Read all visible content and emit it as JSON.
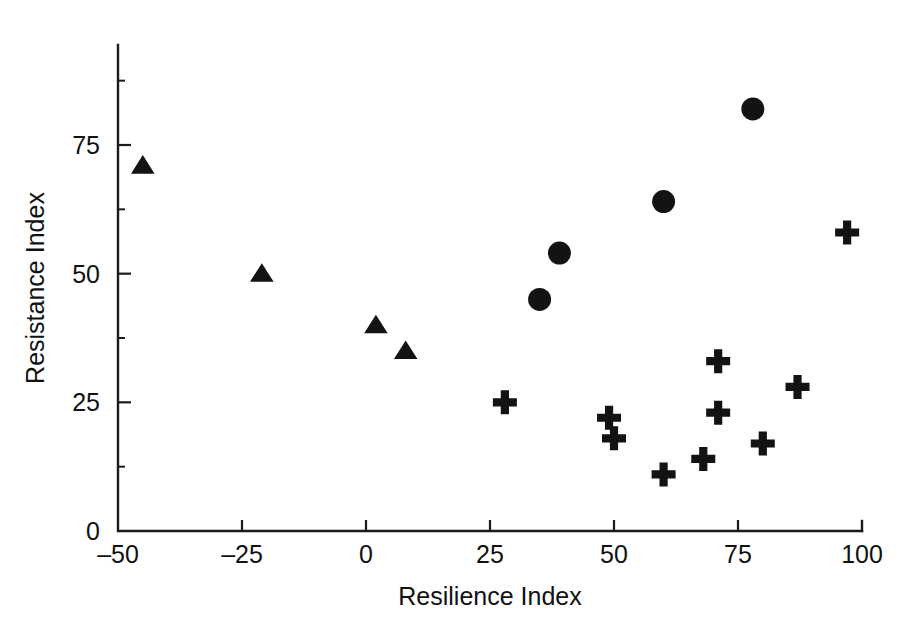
{
  "figure": {
    "background_color": "#ffffff",
    "ink_color": "#131313"
  },
  "chart_data": {
    "type": "scatter",
    "title": "",
    "xlabel": "Resilience Index",
    "ylabel": "Resistance Index",
    "xlim": [
      -50,
      100
    ],
    "ylim": [
      0,
      94
    ],
    "xticks": [
      -50,
      -25,
      0,
      25,
      50,
      75,
      100
    ],
    "xtick_labels": [
      "‒50",
      "‒25",
      "0",
      "25",
      "50",
      "75",
      "100"
    ],
    "yticks": [
      0,
      25,
      50,
      75
    ],
    "ytick_labels": [
      "0",
      "25",
      "50",
      "75"
    ],
    "x_minor_ticks": [],
    "y_minor_ticks": [
      12.5,
      37.5,
      62.5,
      87.5
    ],
    "grid": false,
    "legend": false,
    "legend_position": "none",
    "series": [
      {
        "name": "triangle-group",
        "marker": "triangle",
        "color": "#131313",
        "points": [
          {
            "x": -45,
            "y": 71
          },
          {
            "x": -21,
            "y": 50
          },
          {
            "x": 2,
            "y": 40
          },
          {
            "x": 8,
            "y": 35
          }
        ]
      },
      {
        "name": "circle-group",
        "marker": "circle",
        "color": "#131313",
        "points": [
          {
            "x": 35,
            "y": 45
          },
          {
            "x": 39,
            "y": 54
          },
          {
            "x": 60,
            "y": 64
          },
          {
            "x": 78,
            "y": 82
          }
        ]
      },
      {
        "name": "plus-group",
        "marker": "plus",
        "color": "#131313",
        "points": [
          {
            "x": 28,
            "y": 25
          },
          {
            "x": 49,
            "y": 22
          },
          {
            "x": 50,
            "y": 18
          },
          {
            "x": 60,
            "y": 11
          },
          {
            "x": 68,
            "y": 14
          },
          {
            "x": 71,
            "y": 33
          },
          {
            "x": 71,
            "y": 23
          },
          {
            "x": 80,
            "y": 17
          },
          {
            "x": 87,
            "y": 28
          },
          {
            "x": 97,
            "y": 58
          }
        ]
      }
    ]
  }
}
